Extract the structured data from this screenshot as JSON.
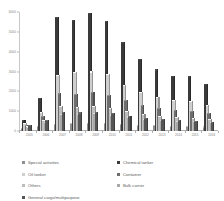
{
  "chart_data": {
    "type": "bar",
    "title": "",
    "subtitle": "",
    "xlabel": "",
    "ylabel": "",
    "grid": false,
    "legend_position": "bottom",
    "categories": [
      "2005",
      "2006",
      "2007",
      "2008",
      "2009",
      "2010",
      "2011",
      "2012",
      "2013",
      "2014",
      "2015",
      "2016"
    ],
    "ylim": [
      0,
      6000
    ],
    "yticks": [
      0,
      1000,
      2000,
      3000,
      4000,
      5000,
      6000
    ],
    "ytick_labels": [
      "0",
      "1000",
      "2000",
      "3000",
      "4000",
      "5000",
      "6000"
    ],
    "series": [
      {
        "name": "Special activities",
        "color": "#8f8f8f",
        "values": [
          120,
          190,
          300,
          330,
          350,
          330,
          300,
          260,
          230,
          210,
          190,
          175
        ]
      },
      {
        "name": "Chemical tanker",
        "color": "#3a3a3a",
        "values": [
          520,
          1600,
          5700,
          5550,
          5900,
          5500,
          4450,
          3600,
          3050,
          2700,
          2700,
          2300
        ]
      },
      {
        "name": "Oil tanker",
        "color": "#cfcfcf",
        "values": [
          330,
          900,
          2750,
          2900,
          2950,
          2800,
          2250,
          1900,
          1650,
          1500,
          1450,
          1250
        ]
      },
      {
        "name": "Container",
        "color": "#6e6e6e",
        "values": [
          260,
          700,
          1850,
          1800,
          1900,
          1750,
          1500,
          1250,
          1100,
          1000,
          950,
          850
        ]
      },
      {
        "name": "Others",
        "color": "#bdbdbd",
        "values": [
          200,
          520,
          1200,
          1150,
          1200,
          1100,
          950,
          800,
          700,
          640,
          600,
          540
        ]
      },
      {
        "name": "Bulk carrier",
        "color": "#a8a8a8",
        "values": [
          150,
          400,
          800,
          820,
          850,
          780,
          680,
          570,
          500,
          460,
          430,
          390
        ]
      },
      {
        "name": "General cargo/multipurpose",
        "color": "#555555",
        "values": [
          260,
          520,
          900,
          880,
          900,
          850,
          720,
          620,
          540,
          500,
          470,
          420
        ]
      }
    ],
    "legend_order": [
      "Special activities",
      "Chemical tanker",
      "Oil tanker",
      "Container",
      "Others",
      "Bulk carrier",
      "General cargo/multipurpose"
    ]
  }
}
